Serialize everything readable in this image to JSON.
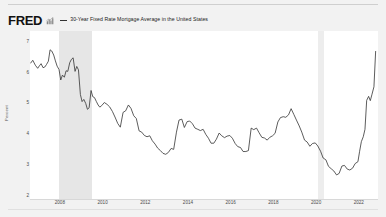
{
  "header": {
    "logo_text": "FRED",
    "logo_icon": "mini-bar-chart-icon",
    "legend_marker": "line-dash-marker",
    "series_label": "30-Year Fixed Rate Mortgage Average in the United States"
  },
  "chart_data": {
    "type": "line",
    "title": "30-Year Fixed Rate Mortgage Average in the United States",
    "xlabel": "",
    "ylabel": "Percent",
    "grid": false,
    "legend_position": "top",
    "xlim": [
      2006.6,
      2022.9
    ],
    "ylim": [
      1.9,
      7.35
    ],
    "xticks": [
      "2008",
      "2010",
      "2012",
      "2014",
      "2016",
      "2018",
      "2020",
      "2022"
    ],
    "xtick_values": [
      2008,
      2010,
      2012,
      2014,
      2016,
      2018,
      2020,
      2022
    ],
    "yticks": [
      "7",
      "6",
      "5",
      "4",
      "3",
      "2"
    ],
    "ytick_values": [
      7,
      6,
      5,
      4,
      3,
      2
    ],
    "line_color": "#333333",
    "recession_color": "#e6e6e6",
    "recession_bands": [
      {
        "label": "Great Recession",
        "start": 2007.95,
        "end": 2009.5
      },
      {
        "label": "COVID-19 Recession",
        "start": 2020.1,
        "end": 2020.35
      }
    ],
    "series": [
      {
        "name": "30-Year Fixed Rate Mortgage Average in the United States",
        "x": [
          2006.62,
          2006.73,
          2006.85,
          2006.96,
          2007.04,
          2007.12,
          2007.21,
          2007.29,
          2007.37,
          2007.46,
          2007.54,
          2007.62,
          2007.71,
          2007.79,
          2007.87,
          2007.96,
          2008.04,
          2008.12,
          2008.21,
          2008.29,
          2008.37,
          2008.46,
          2008.54,
          2008.62,
          2008.71,
          2008.79,
          2008.87,
          2008.96,
          2009.04,
          2009.12,
          2009.21,
          2009.29,
          2009.37,
          2009.46,
          2009.54,
          2009.62,
          2009.71,
          2009.79,
          2009.87,
          2009.96,
          2010.08,
          2010.21,
          2010.33,
          2010.46,
          2010.58,
          2010.71,
          2010.83,
          2010.96,
          2011.08,
          2011.21,
          2011.33,
          2011.46,
          2011.58,
          2011.71,
          2011.83,
          2011.96,
          2012.08,
          2012.21,
          2012.33,
          2012.46,
          2012.58,
          2012.71,
          2012.83,
          2012.96,
          2013.08,
          2013.21,
          2013.33,
          2013.46,
          2013.58,
          2013.71,
          2013.83,
          2013.96,
          2014.08,
          2014.21,
          2014.33,
          2014.46,
          2014.58,
          2014.71,
          2014.83,
          2014.96,
          2015.08,
          2015.21,
          2015.33,
          2015.46,
          2015.58,
          2015.71,
          2015.83,
          2015.96,
          2016.08,
          2016.21,
          2016.33,
          2016.46,
          2016.58,
          2016.71,
          2016.83,
          2016.96,
          2017.08,
          2017.21,
          2017.33,
          2017.46,
          2017.58,
          2017.71,
          2017.83,
          2017.96,
          2018.08,
          2018.21,
          2018.33,
          2018.46,
          2018.58,
          2018.71,
          2018.83,
          2018.96,
          2019.08,
          2019.21,
          2019.33,
          2019.46,
          2019.58,
          2019.71,
          2019.83,
          2019.96,
          2020.08,
          2020.21,
          2020.33,
          2020.46,
          2020.58,
          2020.71,
          2020.83,
          2020.96,
          2021.08,
          2021.21,
          2021.33,
          2021.46,
          2021.58,
          2021.71,
          2021.83,
          2021.96,
          2022.04,
          2022.12,
          2022.21,
          2022.29,
          2022.37,
          2022.46,
          2022.54,
          2022.62,
          2022.71,
          2022.79
        ],
        "values": [
          6.3,
          6.4,
          6.24,
          6.14,
          6.22,
          6.29,
          6.16,
          6.18,
          6.26,
          6.37,
          6.74,
          6.7,
          6.57,
          6.38,
          6.21,
          6.1,
          5.76,
          5.92,
          5.85,
          6.06,
          6.04,
          6.32,
          6.43,
          6.48,
          6.04,
          6.2,
          6.09,
          5.29,
          5.06,
          5.13,
          5.0,
          4.81,
          4.86,
          5.42,
          5.22,
          5.19,
          5.06,
          4.95,
          4.88,
          4.93,
          5.03,
          4.97,
          4.89,
          4.74,
          4.56,
          4.35,
          4.23,
          4.71,
          4.76,
          4.95,
          4.84,
          4.6,
          4.51,
          4.11,
          4.07,
          3.96,
          3.92,
          3.95,
          3.79,
          3.68,
          3.55,
          3.47,
          3.38,
          3.35,
          3.41,
          3.54,
          3.51,
          4.07,
          4.46,
          4.49,
          4.22,
          4.41,
          4.43,
          4.34,
          4.2,
          4.16,
          4.12,
          4.16,
          4.0,
          3.87,
          3.71,
          3.71,
          3.84,
          4.04,
          3.95,
          3.89,
          3.94,
          3.96,
          3.87,
          3.7,
          3.6,
          3.57,
          3.44,
          3.44,
          3.47,
          4.2,
          4.15,
          4.2,
          4.05,
          3.9,
          3.88,
          3.81,
          3.9,
          3.95,
          4.03,
          4.4,
          4.54,
          4.57,
          4.55,
          4.63,
          4.83,
          4.64,
          4.46,
          4.27,
          4.07,
          3.81,
          3.75,
          3.61,
          3.7,
          3.72,
          3.62,
          3.45,
          3.23,
          3.17,
          2.96,
          2.88,
          2.81,
          2.68,
          2.73,
          2.97,
          2.99,
          2.87,
          2.84,
          2.9,
          3.05,
          3.11,
          3.45,
          3.76,
          3.92,
          4.16,
          5.1,
          5.23,
          5.09,
          5.3,
          5.54,
          6.7
        ]
      }
    ]
  }
}
